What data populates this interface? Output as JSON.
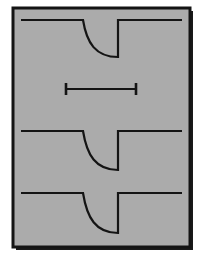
{
  "figure": {
    "canvas": {
      "width": 208,
      "height": 264,
      "page_color": "#ffffff"
    },
    "frame": {
      "name": "drawing-frame",
      "x": 13,
      "y": 8,
      "width": 177,
      "height": 239,
      "fill_color": "#ababab",
      "stroke_color": "#141414",
      "stroke_width": 3,
      "shadow_color": "#1a1a1a",
      "shadow_offset": 3
    },
    "line_color": "#141414",
    "line_width": 2.2,
    "profiles": [
      {
        "name": "profile-top",
        "label": "Shallow notch profile",
        "baseline_y": 20,
        "left_x": 21,
        "right_x": 182,
        "notch_left_x": 83,
        "notch_right_x": 118,
        "notch_bottom_y": 57,
        "notch_depth": 37,
        "entry": "filleted-curve",
        "exit": "square-corner"
      },
      {
        "name": "profile-middle",
        "label": "Medium notch profile",
        "baseline_y": 131,
        "left_x": 21,
        "right_x": 182,
        "notch_left_x": 83,
        "notch_right_x": 118,
        "notch_bottom_y": 170,
        "notch_depth": 39,
        "entry": "filleted-curve",
        "exit": "square-corner"
      },
      {
        "name": "profile-bottom",
        "label": "Deep notch profile",
        "baseline_y": 193,
        "left_x": 21,
        "right_x": 182,
        "notch_left_x": 83,
        "notch_right_x": 118,
        "notch_bottom_y": 233,
        "notch_depth": 40,
        "entry": "filleted-curve",
        "exit": "square-corner"
      }
    ],
    "dimension": {
      "name": "dimension-line",
      "label": "",
      "y": 89,
      "start_x": 66,
      "end_x": 136,
      "length_px": 70,
      "tick_half_height": 6,
      "tick_width": 2.6,
      "style": "plain-bar-with-end-ticks"
    }
  }
}
